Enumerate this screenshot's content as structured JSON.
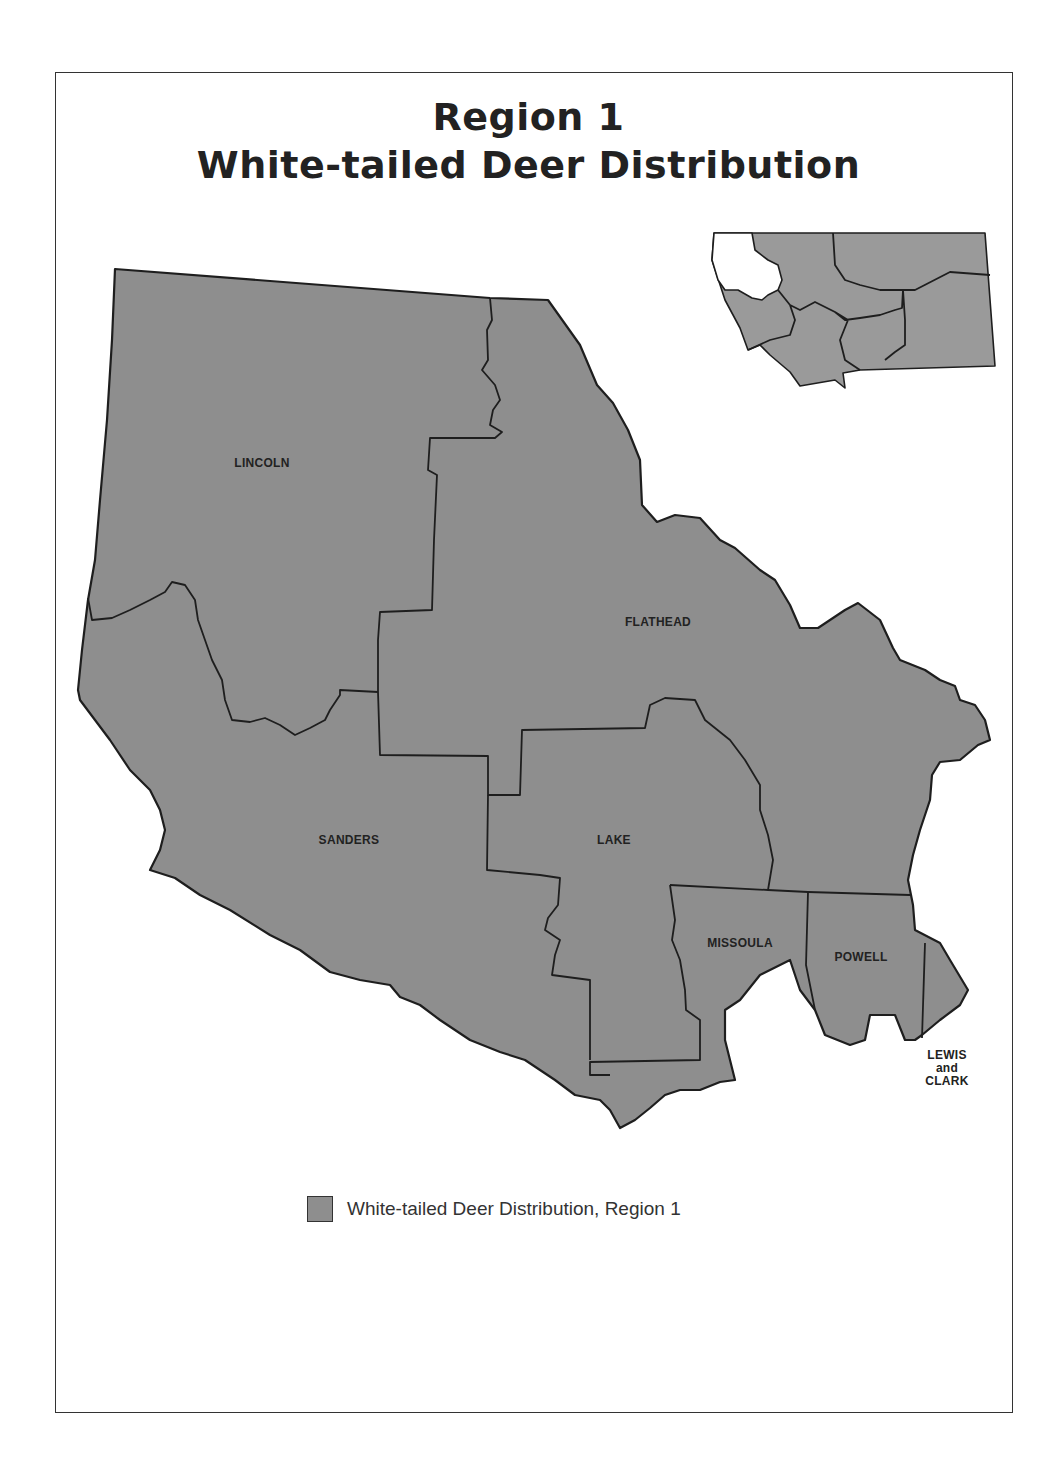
{
  "title": {
    "line1": "Region 1",
    "line2": "White-tailed Deer Distribution"
  },
  "map": {
    "fill_color": "#8e8e8e",
    "border_color": "#1e1e1e",
    "counties": [
      {
        "name": "LINCOLN"
      },
      {
        "name": "FLATHEAD"
      },
      {
        "name": "SANDERS"
      },
      {
        "name": "LAKE"
      },
      {
        "name": "MISSOULA"
      },
      {
        "name": "POWELL"
      },
      {
        "name": "LEWIS and CLARK",
        "lines": [
          "LEWIS",
          "and",
          "CLARK"
        ]
      }
    ]
  },
  "inset": {
    "description": "Montana state outline with Region 1 highlighted",
    "highlight_color": "#ffffff",
    "other_regions_color": "#9a9a9a"
  },
  "legend": {
    "swatch_color": "#8e8e8e",
    "label": "White-tailed Deer Distribution, Region 1"
  }
}
